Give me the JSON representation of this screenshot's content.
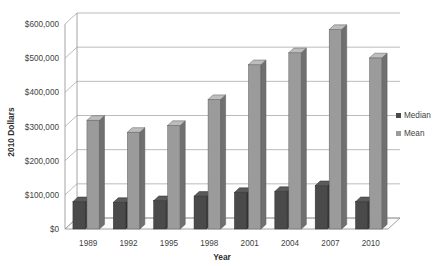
{
  "chart_data": {
    "type": "bar",
    "title": "",
    "subtitle": "",
    "xlabel": "Year",
    "ylabel": "2010 Dollars",
    "categories": [
      "1989",
      "1992",
      "1995",
      "1998",
      "2001",
      "2004",
      "2007",
      "2010"
    ],
    "series": [
      {
        "name": "Median",
        "color": "#4a4a4a",
        "values": [
          80000,
          78000,
          83000,
          96000,
          107000,
          110000,
          127000,
          80000
        ]
      },
      {
        "name": "Mean",
        "color": "#9b9b9b",
        "values": [
          318000,
          283000,
          303000,
          379000,
          481000,
          516000,
          584000,
          501000
        ]
      }
    ],
    "ylim": [
      0,
      600000
    ],
    "ytick_labels": [
      "$0",
      "$100,000",
      "$200,000",
      "$300,000",
      "$400,000",
      "$500,000",
      "$600,000"
    ],
    "ytick_values": [
      0,
      100000,
      200000,
      300000,
      400000,
      500000,
      600000
    ],
    "grid": true,
    "grid_axis": "y",
    "legend_position": "right",
    "style": "3d-column",
    "background_color": "#ffffff",
    "gridline_color": "#9f9f9f",
    "axis_text_color": "#3f3f3f"
  },
  "axis": {
    "y_title": "2010 Dollars",
    "x_title": "Year"
  },
  "legend": {
    "entries": [
      {
        "label": "Median",
        "color": "#4a4a4a"
      },
      {
        "label": "Mean",
        "color": "#9b9b9b"
      }
    ]
  }
}
